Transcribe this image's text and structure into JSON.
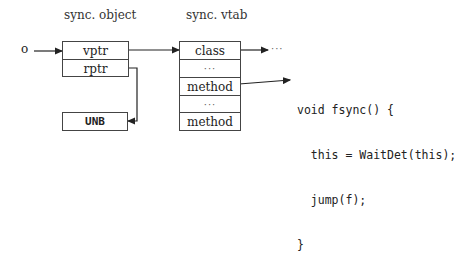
{
  "labels": {
    "object_title": "sync. object",
    "vtab_title": "sync. vtab",
    "pointer_name": "o",
    "trailing_dots": "···"
  },
  "sync_object": {
    "fields": [
      "vptr",
      "rptr"
    ]
  },
  "unb_box": {
    "label": "UNB"
  },
  "sync_vtab": {
    "entries": [
      "class",
      "···",
      "method",
      "···",
      "method"
    ]
  },
  "code": {
    "lines": [
      "void fsync() {",
      "  this = WaitDet(this);",
      "  jump(f);",
      "}"
    ]
  }
}
